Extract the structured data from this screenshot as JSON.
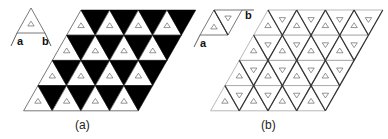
{
  "panels": [
    {
      "id": "a",
      "caption": "(a)",
      "axis_labels": [
        "a",
        "b"
      ],
      "description": "Triangular lattice with alternating black down-triangles and white up-triangles containing small up-triangle markers"
    },
    {
      "id": "b",
      "caption": "(b)",
      "axis_labels": [
        "a",
        "b"
      ],
      "description": "Triangular lattice with all white triangles; up-triangles contain small up markers and down-triangles contain small down markers; thicker edges outline rhombic unit cells"
    }
  ],
  "lattice": {
    "rows": 4,
    "cols": 4
  },
  "colors": {
    "fill_dark": "#000000",
    "line": "#555555",
    "line_thick": "#333333"
  }
}
